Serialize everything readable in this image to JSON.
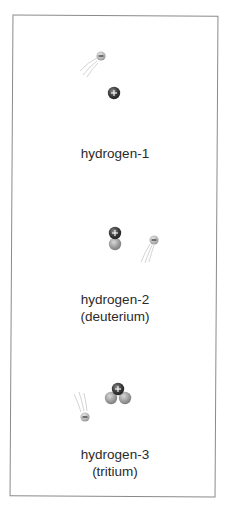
{
  "figure": {
    "isotopes": [
      {
        "name": "hydrogen-1",
        "subtitle": ""
      },
      {
        "name": "hydrogen-2",
        "subtitle": "(deuterium)"
      },
      {
        "name": "hydrogen-3",
        "subtitle": "(tritium)"
      }
    ],
    "legend_symbols": {
      "proton": "+",
      "electron": "−"
    },
    "colors": {
      "proton": "#3a3a3a",
      "neutron": "#9a9a9a",
      "electron": "#b0b0b0",
      "border": "#8a8a8a",
      "text": "#2a2a2a"
    }
  }
}
